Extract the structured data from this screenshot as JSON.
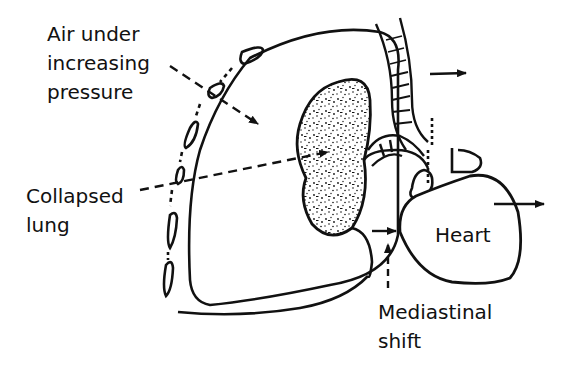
{
  "diagram": {
    "labels": {
      "air_pressure": [
        "Air under",
        "increasing",
        "pressure"
      ],
      "collapsed_lung": [
        "Collapsed",
        "lung"
      ],
      "heart": "Heart",
      "mediastinal_shift": [
        "Mediastinal",
        "shift"
      ]
    },
    "colors": {
      "ink": "#111111",
      "background": "#ffffff"
    }
  }
}
